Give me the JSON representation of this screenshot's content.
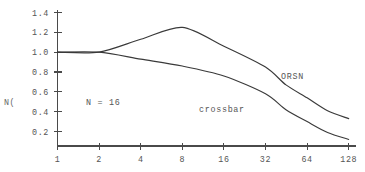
{
  "chart_data": {
    "type": "line",
    "title": "",
    "xlabel": "",
    "ylabel": "N(",
    "annotation": "N = 16",
    "xscale": "log2",
    "categories": [
      1,
      2,
      4,
      8,
      16,
      32,
      64,
      128
    ],
    "xticklabels": [
      "1",
      "2",
      "4",
      "8",
      "16",
      "32",
      "64",
      "128"
    ],
    "yticklabels": [
      "0.2",
      "0.4",
      "0.6",
      "0.8",
      "1.0",
      "1.2",
      "1.4"
    ],
    "yticks": [
      0.2,
      0.4,
      0.6,
      0.8,
      1.0,
      1.2,
      1.4
    ],
    "ylim": [
      0.0,
      1.5
    ],
    "xlim": [
      1,
      128
    ],
    "grid": false,
    "legend": "inline-labels",
    "series": [
      {
        "name": "ORSN",
        "label": "ORSN",
        "color": "#3a3a3a",
        "x": [
          1,
          2,
          4,
          8,
          16,
          32,
          45,
          64,
          90,
          128
        ],
        "values": [
          1.0,
          1.0,
          1.13,
          1.25,
          1.06,
          0.85,
          0.67,
          0.54,
          0.41,
          0.33
        ]
      },
      {
        "name": "crossbar",
        "label": "crossbar",
        "color": "#3a3a3a",
        "x": [
          1,
          2,
          4,
          8,
          16,
          32,
          45,
          64,
          90,
          128
        ],
        "values": [
          1.0,
          1.0,
          0.93,
          0.86,
          0.76,
          0.58,
          0.42,
          0.3,
          0.19,
          0.12
        ]
      }
    ]
  },
  "axis": {
    "y_axis_label": "N(",
    "tick_labels_y": [
      "1.4",
      "1.2",
      "1.0",
      "0.8",
      "0.6",
      "0.4",
      "0.2"
    ],
    "tick_labels_x": [
      "1",
      "2",
      "4",
      "8",
      "16",
      "32",
      "64",
      "128"
    ]
  },
  "annotations": {
    "condition": "N = 16",
    "series_label_top": "ORSN",
    "series_label_bottom": "crossbar"
  }
}
